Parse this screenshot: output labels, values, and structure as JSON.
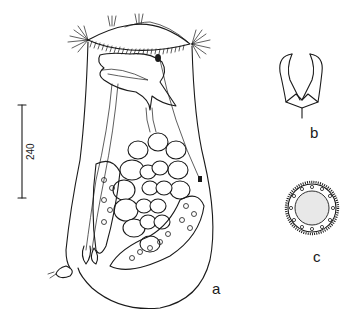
{
  "figure": {
    "panels": [
      {
        "id": "a",
        "label": "a",
        "description": "whole animal, lateral view"
      },
      {
        "id": "b",
        "label": "b",
        "description": "trophi / jaw apparatus"
      },
      {
        "id": "c",
        "label": "c",
        "description": "resting egg with spiny surface"
      }
    ],
    "scale_bar": {
      "value": "240",
      "orientation": "vertical"
    },
    "colors": {
      "ink": "#1a1a1a",
      "background": "#ffffff"
    }
  }
}
